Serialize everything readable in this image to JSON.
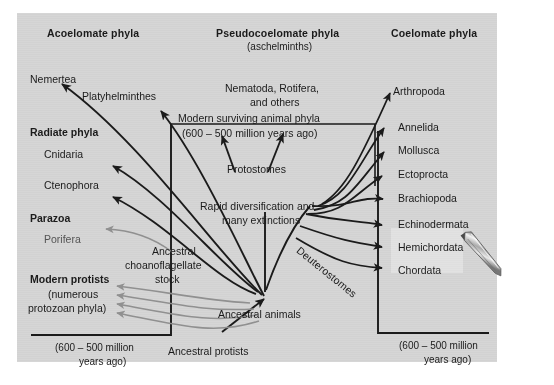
{
  "figure": {
    "background_color": "#d6d6d6",
    "page_color": "#ffffff",
    "line_color": "#1b1b1b",
    "faded_line_color": "#909090"
  },
  "headers": {
    "left": "Acoelomate phyla",
    "center": "Pseudocoelomate phyla",
    "center_sub": "(aschelminths)",
    "right": "Coelomate phyla"
  },
  "left_column": {
    "phyla_top": [
      "Nemertea",
      "Platyhelminthes"
    ],
    "groups": [
      {
        "name": "Radiate phyla",
        "phyla": [
          "Cnidaria",
          "Ctenophora"
        ]
      },
      {
        "name": "Parazoa",
        "phyla": [
          "Porifera"
        ]
      }
    ],
    "protists": {
      "title": "Modern protists",
      "line2": "(numerous",
      "line3": "protozoan phyla)"
    },
    "timescale_line1": "(600 – 500 million",
    "timescale_line2": "years ago)"
  },
  "center_column": {
    "pseudocoelomate_phyla_line1": "Nematoda, Rotifera,",
    "pseudocoelomate_phyla_line2": "and others",
    "box_line1": "Modern surviving animal phyla",
    "box_line2": "(600 – 500 million years ago)",
    "protostomes": "Protostomes",
    "deuterostomes": "Deuterostomes",
    "event_line1": "Rapid diversification and",
    "event_line2": "many extinctions",
    "ancestral_animals": "Ancestral animals",
    "ancestral_protists": "Ancestral protists",
    "choanoflagellate_line1": "Ancestral",
    "choanoflagellate_line2": "choanoflagellate",
    "choanoflagellate_line3": "stock"
  },
  "right_column": {
    "phyla": [
      "Arthropoda",
      "Annelida",
      "Mollusca",
      "Ectoprocta",
      "Brachiopoda",
      "Echinodermata",
      "Hemichordata",
      "Chordata"
    ],
    "timescale_line1": "(600 – 500 million",
    "timescale_line2": "years ago)"
  },
  "cursor": {
    "icon": "pen-cursor",
    "selection_label": "text-selection-highlight"
  }
}
